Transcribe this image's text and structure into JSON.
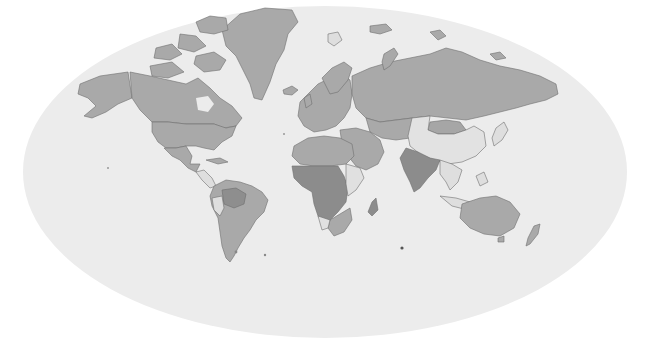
{
  "map": {
    "projection": "mollweide-like",
    "colors": {
      "background": "#ffffff",
      "ocean": "#ededed",
      "level_none": "#ececec",
      "level_low": "#e3e3e3",
      "level_mid": "#a8a8a8",
      "level_high": "#8c8c8c",
      "border": "#6f6f6f"
    },
    "regions": [
      {
        "name": "greenland",
        "level": "mid"
      },
      {
        "name": "canada",
        "level": "mid"
      },
      {
        "name": "alaska",
        "level": "mid"
      },
      {
        "name": "usa",
        "level": "mid"
      },
      {
        "name": "mexico",
        "level": "mid"
      },
      {
        "name": "central-america",
        "level": "low"
      },
      {
        "name": "south-america",
        "level": "mid"
      },
      {
        "name": "amazon-region",
        "level": "high"
      },
      {
        "name": "europe",
        "level": "mid"
      },
      {
        "name": "russia",
        "level": "mid"
      },
      {
        "name": "central-asia",
        "level": "mid"
      },
      {
        "name": "middle-east",
        "level": "mid"
      },
      {
        "name": "china",
        "level": "low"
      },
      {
        "name": "mongolia",
        "level": "mid"
      },
      {
        "name": "india",
        "level": "high"
      },
      {
        "name": "southeast-asia",
        "level": "low"
      },
      {
        "name": "north-africa",
        "level": "mid"
      },
      {
        "name": "sub-saharan-africa",
        "level": "high"
      },
      {
        "name": "east-africa",
        "level": "low"
      },
      {
        "name": "southern-africa",
        "level": "mid"
      },
      {
        "name": "madagascar",
        "level": "high"
      },
      {
        "name": "australia",
        "level": "mid"
      },
      {
        "name": "new-zealand",
        "level": "mid"
      },
      {
        "name": "japan",
        "level": "low"
      },
      {
        "name": "indonesia",
        "level": "low"
      }
    ]
  }
}
